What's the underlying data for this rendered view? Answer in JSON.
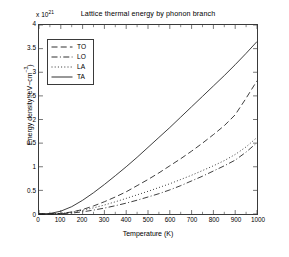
{
  "chart_data": {
    "type": "line",
    "title": "Lattice thermal energy by phonon branch",
    "xlabel": "Temperature (K)",
    "ylabel_text": "Energy density (eV",
    "ylabel_mid": "cm",
    "ylabel_sup": "-3",
    "ylabel_full": "Energy density (eV-cm-3)",
    "y_multiplier": "x 10",
    "y_multiplier_exp": "21",
    "xlim": [
      0,
      1000
    ],
    "ylim": [
      0,
      4
    ],
    "grid": false,
    "legend_position": "upper left inside axes",
    "x_ticks": [
      0,
      100,
      200,
      300,
      400,
      500,
      600,
      700,
      800,
      900,
      1000
    ],
    "x_tick_labels": [
      "0",
      "100",
      "200",
      "300",
      "400",
      "500",
      "600",
      "700",
      "800",
      "900",
      "1000"
    ],
    "y_ticks": [
      0,
      0.5,
      1,
      1.5,
      2,
      2.5,
      3,
      3.5,
      4
    ],
    "y_tick_labels": [
      "0",
      "0.5",
      "1",
      "1.5",
      "2",
      "2.5",
      "3",
      "3.5",
      "4"
    ],
    "x": [
      0,
      50,
      100,
      150,
      200,
      250,
      300,
      350,
      400,
      450,
      500,
      550,
      600,
      650,
      700,
      750,
      800,
      850,
      900,
      950,
      1000
    ],
    "series": [
      {
        "name": "TO",
        "style": "dashed",
        "color": "#1a1a1a",
        "values": [
          0,
          0.002,
          0.012,
          0.042,
          0.095,
          0.17,
          0.26,
          0.36,
          0.47,
          0.6,
          0.73,
          0.87,
          1.02,
          1.17,
          1.33,
          1.5,
          1.68,
          1.87,
          2.1,
          2.45,
          2.82
        ]
      },
      {
        "name": "LO",
        "style": "dashdot",
        "color": "#1a1a1a",
        "values": [
          0,
          0.001,
          0.006,
          0.02,
          0.046,
          0.082,
          0.125,
          0.175,
          0.23,
          0.292,
          0.36,
          0.43,
          0.51,
          0.6,
          0.7,
          0.8,
          0.91,
          1.02,
          1.14,
          1.31,
          1.51
        ]
      },
      {
        "name": "LA",
        "style": "dotted",
        "color": "#1a1a1a",
        "values": [
          0,
          0.002,
          0.014,
          0.04,
          0.08,
          0.13,
          0.19,
          0.258,
          0.33,
          0.405,
          0.48,
          0.56,
          0.64,
          0.73,
          0.82,
          0.92,
          1.02,
          1.13,
          1.26,
          1.42,
          1.62
        ]
      },
      {
        "name": "TA",
        "style": "solid",
        "color": "#1a1a1a",
        "values": [
          0,
          0.01,
          0.06,
          0.155,
          0.29,
          0.45,
          0.625,
          0.81,
          1.0,
          1.2,
          1.41,
          1.62,
          1.83,
          2.05,
          2.27,
          2.49,
          2.71,
          2.93,
          3.16,
          3.4,
          3.65
        ]
      }
    ]
  },
  "legend": {
    "items": [
      {
        "label": "TO"
      },
      {
        "label": "LO"
      },
      {
        "label": "LA"
      },
      {
        "label": "TA"
      }
    ]
  }
}
